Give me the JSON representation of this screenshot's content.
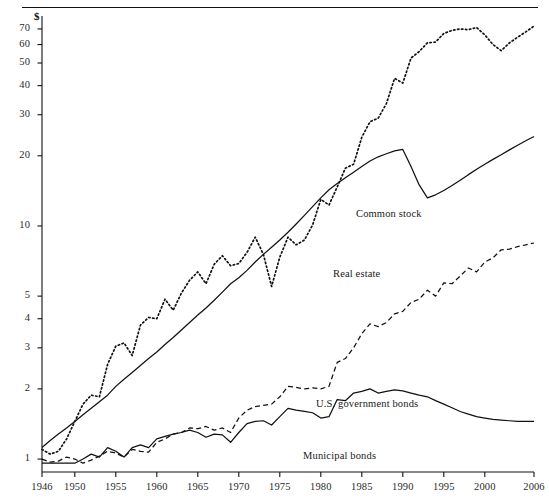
{
  "figure": {
    "currency_symbol": "$",
    "axis": {
      "y_ticks": [
        1,
        2,
        3,
        4,
        5,
        10,
        20,
        30,
        40,
        50,
        60,
        70
      ],
      "y_scale": "log",
      "ylim": [
        0.88,
        78
      ],
      "x_ticks": [
        1946,
        1950,
        1955,
        1960,
        1965,
        1970,
        1975,
        1980,
        1985,
        1990,
        1995,
        2000,
        2006
      ],
      "xlim": [
        1946,
        2006
      ]
    },
    "series_labels": {
      "common_stock": "Common stock",
      "real_estate": "Real estate",
      "government_bonds": "U.S. government bonds",
      "municipal_bonds": "Municipal bonds"
    }
  },
  "chart_data": {
    "type": "line",
    "title": "",
    "xlabel": "",
    "ylabel": "$",
    "yscale": "log",
    "ylim": [
      0.88,
      78
    ],
    "xlim": [
      1946,
      2006
    ],
    "grid": false,
    "legend": "inline-annotations",
    "x": [
      1946,
      1947,
      1948,
      1949,
      1950,
      1951,
      1952,
      1953,
      1954,
      1955,
      1956,
      1957,
      1958,
      1959,
      1960,
      1961,
      1962,
      1963,
      1964,
      1965,
      1966,
      1967,
      1968,
      1969,
      1970,
      1971,
      1972,
      1973,
      1974,
      1975,
      1976,
      1977,
      1978,
      1979,
      1980,
      1981,
      1982,
      1983,
      1984,
      1985,
      1986,
      1987,
      1988,
      1989,
      1990,
      1991,
      1992,
      1993,
      1994,
      1995,
      1996,
      1997,
      1998,
      1999,
      2000,
      2001,
      2002,
      2003,
      2004,
      2005,
      2006
    ],
    "series": [
      {
        "name": "Common stock",
        "style": "dotted",
        "values": [
          1.1,
          1.05,
          1.08,
          1.22,
          1.45,
          1.72,
          1.88,
          1.85,
          2.55,
          3.05,
          3.15,
          2.78,
          3.75,
          4.05,
          4.0,
          4.85,
          4.35,
          5.15,
          5.85,
          6.35,
          5.65,
          6.85,
          7.45,
          6.75,
          6.9,
          7.7,
          8.95,
          7.55,
          5.5,
          7.35,
          8.95,
          8.3,
          8.7,
          10.1,
          13.0,
          12.3,
          14.7,
          17.7,
          18.4,
          24.0,
          28.0,
          29.0,
          33.5,
          43.0,
          41.0,
          52.5,
          56.0,
          61.0,
          61.5,
          67.0,
          69.0,
          70.0,
          69.5,
          71.0,
          66.0,
          60.0,
          56.5,
          61.0,
          64.5,
          68.0,
          72.0
        ]
      },
      {
        "name": "Real estate",
        "style": "solid",
        "values": [
          1.12,
          1.2,
          1.28,
          1.36,
          1.45,
          1.55,
          1.65,
          1.76,
          1.88,
          2.05,
          2.2,
          2.35,
          2.52,
          2.7,
          2.88,
          3.1,
          3.32,
          3.58,
          3.85,
          4.15,
          4.45,
          4.8,
          5.2,
          5.65,
          6.0,
          6.45,
          7.0,
          7.55,
          8.1,
          8.7,
          9.4,
          10.2,
          11.1,
          12.1,
          13.2,
          14.3,
          15.2,
          16.1,
          17.0,
          18.0,
          19.0,
          19.8,
          20.4,
          21.0,
          21.3,
          18.0,
          15.0,
          13.2,
          13.6,
          14.2,
          14.9,
          15.7,
          16.6,
          17.5,
          18.4,
          19.3,
          20.2,
          21.2,
          22.2,
          23.2,
          24.2
        ]
      },
      {
        "name": "U.S. government bonds",
        "style": "dashed",
        "values": [
          1.0,
          0.97,
          0.98,
          1.02,
          1.0,
          0.96,
          0.99,
          1.03,
          1.08,
          1.06,
          1.02,
          1.1,
          1.08,
          1.07,
          1.18,
          1.22,
          1.28,
          1.3,
          1.36,
          1.35,
          1.38,
          1.33,
          1.36,
          1.3,
          1.5,
          1.62,
          1.68,
          1.7,
          1.72,
          1.85,
          2.05,
          2.03,
          2.0,
          2.02,
          2.0,
          2.05,
          2.6,
          2.7,
          3.0,
          3.45,
          3.8,
          3.7,
          3.85,
          4.2,
          4.3,
          4.7,
          4.85,
          5.3,
          5.0,
          5.7,
          5.65,
          6.1,
          6.6,
          6.35,
          7.0,
          7.3,
          7.9,
          7.95,
          8.15,
          8.3,
          8.45
        ]
      },
      {
        "name": "Municipal bonds",
        "style": "solid",
        "values": [
          0.96,
          0.96,
          0.96,
          0.96,
          0.96,
          1.0,
          1.05,
          1.02,
          1.12,
          1.08,
          1.02,
          1.12,
          1.15,
          1.12,
          1.22,
          1.25,
          1.28,
          1.3,
          1.33,
          1.3,
          1.24,
          1.28,
          1.27,
          1.18,
          1.3,
          1.42,
          1.45,
          1.46,
          1.4,
          1.52,
          1.65,
          1.62,
          1.6,
          1.58,
          1.5,
          1.52,
          1.8,
          1.78,
          1.92,
          1.95,
          2.0,
          1.92,
          1.95,
          1.98,
          1.96,
          1.92,
          1.88,
          1.85,
          1.78,
          1.72,
          1.66,
          1.6,
          1.56,
          1.52,
          1.5,
          1.48,
          1.47,
          1.46,
          1.45,
          1.45,
          1.45
        ]
      }
    ]
  }
}
